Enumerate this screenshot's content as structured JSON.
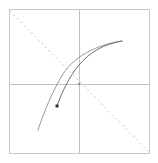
{
  "figure": {
    "title": "",
    "background_color": "#ffffff"
  },
  "chart_data": {
    "type": "line",
    "title": "",
    "xlabel": "",
    "ylabel": "",
    "xlim": [
      -1,
      1
    ],
    "ylim": [
      -1,
      1
    ],
    "grid": false,
    "legend": null,
    "axes_style": "centered-crosshair",
    "frame": {
      "name": "plot-frame",
      "x": 9,
      "y": 9,
      "width": 140,
      "height": 144,
      "stroke_color": "#c9c9c9",
      "stroke_width": 1
    },
    "axes": [
      {
        "name": "vertical-axis",
        "orientation": "vertical",
        "position_px": 79,
        "from_px": [
          79,
          9
        ],
        "to_px": [
          79,
          153
        ],
        "color": "#c2c2c2",
        "width": 1,
        "style": "solid"
      },
      {
        "name": "horizontal-axis",
        "orientation": "horizontal",
        "position_px": 84,
        "from_px": [
          9,
          84
        ],
        "to_px": [
          149,
          84
        ],
        "color": "#c2c2c2",
        "width": 1,
        "style": "solid"
      }
    ],
    "origin_marker": {
      "name": "origin-point",
      "x_px": 79,
      "y_px": 84,
      "size_px": 2,
      "color": "#8a8a8a"
    },
    "reference_line": {
      "name": "diagonal-dashed-line",
      "from_px": [
        10,
        11
      ],
      "to_px": [
        148,
        151
      ],
      "color": "#c6c6c6",
      "width": 1,
      "style": "dashed",
      "dash_pattern": "2 3"
    },
    "series": [
      {
        "name": "outer-curve",
        "color": "#8d8d8d",
        "width": 0.9,
        "style": "solid",
        "marker": null,
        "path_px": "M 38,130 C 44,112 52,92 63,74 C 74,57 95,45 122,41"
      },
      {
        "name": "inner-curve",
        "color": "#5d5d5d",
        "width": 0.9,
        "style": "solid",
        "marker": "square",
        "marker_px": [
          57,
          106
        ],
        "marker_size_px": 3,
        "marker_color": "#303030",
        "path_px": "M 57,106 C 62,92 69,77 79,65 C 90,52 104,44 122,41"
      }
    ]
  }
}
